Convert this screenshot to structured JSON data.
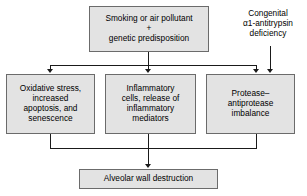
{
  "diagram": {
    "type": "flowchart",
    "background_color": "#ffffff",
    "node_fill_color": "#e3e3e3",
    "node_border_color": "#6b6b6b",
    "connector_color": "#1a1a1a",
    "nodes": [
      {
        "id": "cause",
        "lines": [
          "Smoking or air pollutant",
          "+",
          "genetic predisposition"
        ]
      },
      {
        "id": "oxidative",
        "lines": [
          "Oxidative stress,",
          "increased",
          "apoptosis, and",
          "senescence"
        ]
      },
      {
        "id": "inflammatory",
        "lines": [
          "Inflammatory",
          "cells, release of",
          "inflammatory",
          "mediators"
        ]
      },
      {
        "id": "protease",
        "lines": [
          "Protease–",
          "antiprotease",
          "imbalance"
        ]
      },
      {
        "id": "outcome",
        "lines": [
          "Alveolar wall destruction"
        ]
      }
    ],
    "free_text": [
      {
        "id": "congenital",
        "lines": [
          "Congenital",
          "α1-antitrypsin",
          "deficiency"
        ]
      }
    ],
    "edges": [
      {
        "from": "cause",
        "to": "oxidative"
      },
      {
        "from": "cause",
        "to": "inflammatory"
      },
      {
        "from": "cause",
        "to": "protease"
      },
      {
        "from": "congenital",
        "to": "protease"
      },
      {
        "from": "oxidative",
        "to": "outcome"
      },
      {
        "from": "inflammatory",
        "to": "outcome"
      },
      {
        "from": "protease",
        "to": "outcome"
      }
    ]
  }
}
